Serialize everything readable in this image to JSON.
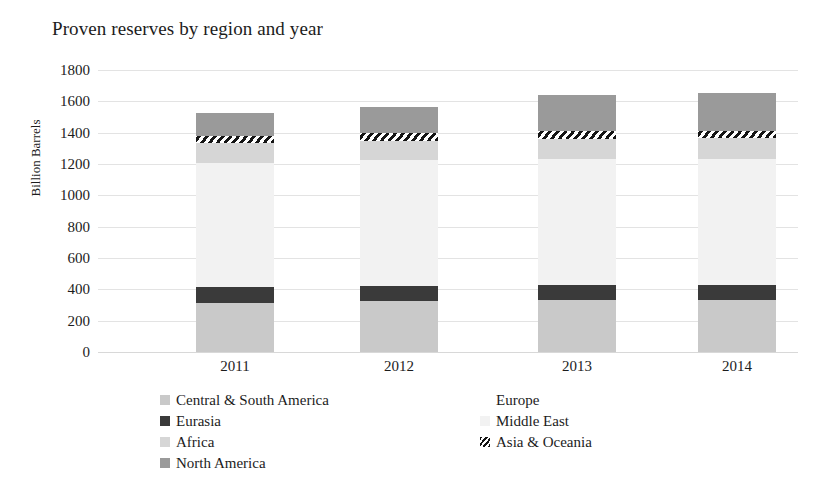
{
  "chart_data": {
    "type": "bar",
    "subtype": "stacked-column",
    "title": "Proven reserves by region and year",
    "xlabel": "",
    "ylabel": "Billion Barrels",
    "categories": [
      "2011",
      "2012",
      "2013",
      "2014"
    ],
    "ylim": [
      0,
      1800
    ],
    "ytick_step": 200,
    "yticks": [
      "1800",
      "1600",
      "1400",
      "1200",
      "1000",
      "800",
      "600",
      "400",
      "200",
      "0"
    ],
    "grid": true,
    "legend_position": "bottom",
    "series": [
      {
        "name": "Central & South America",
        "color": "#c9c9c9",
        "pattern": "solid",
        "values": [
          316,
          326,
          329,
          330
        ]
      },
      {
        "name": "Eurasia",
        "color": "#3a3a3a",
        "pattern": "solid",
        "values": [
          98,
          98,
          99,
          99
        ]
      },
      {
        "name": "Middle East",
        "color": "#f2f2f2",
        "pattern": "solid",
        "values": [
          795,
          799,
          804,
          806
        ]
      },
      {
        "name": "Africa",
        "color": "#d6d6d6",
        "pattern": "solid",
        "values": [
          124,
          126,
          128,
          128
        ]
      },
      {
        "name": "Asia & Oceania",
        "color": "#ffffff",
        "pattern": "hatch",
        "values": [
          48,
          48,
          48,
          48
        ]
      },
      {
        "name": "North America",
        "color": "#9a9a9a",
        "pattern": "solid",
        "values": [
          143,
          170,
          235,
          240
        ]
      },
      {
        "name": "Europe",
        "color": "#ffffff",
        "pattern": "solid",
        "values": [
          0,
          0,
          0,
          0
        ]
      }
    ],
    "totals": [
      1480,
      1523,
      1643,
      1651
    ],
    "annotations": []
  },
  "legend": {
    "left_column": [
      {
        "label": "Central & South America",
        "swatch": "#c9c9c9",
        "pattern": "solid"
      },
      {
        "label": "Eurasia",
        "swatch": "#3a3a3a",
        "pattern": "solid"
      },
      {
        "label": "Africa",
        "swatch": "#d6d6d6",
        "pattern": "solid"
      },
      {
        "label": "North America",
        "swatch": "#9a9a9a",
        "pattern": "solid"
      }
    ],
    "right_column": [
      {
        "label": "Europe",
        "swatch": "#ffffff",
        "pattern": "solid"
      },
      {
        "label": "Middle East",
        "swatch": "#f2f2f2",
        "pattern": "solid"
      },
      {
        "label": "Asia & Oceania",
        "swatch": "#ffffff",
        "pattern": "hatch"
      }
    ]
  },
  "colors": {
    "gridline": "#e3e3e3",
    "text": "#1c1c1c",
    "background": "#ffffff"
  }
}
